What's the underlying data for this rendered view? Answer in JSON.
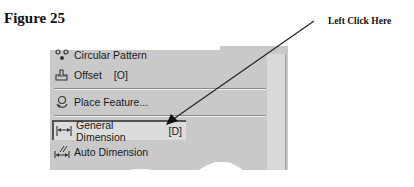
{
  "figure": {
    "title": "Figure 25",
    "callout_text": "Left Click Here"
  },
  "menu": {
    "items": [
      {
        "label": "Circular Pattern",
        "shortcut": "",
        "icon": "circular-pattern-icon"
      },
      {
        "label": "Offset",
        "shortcut": "[O]",
        "icon": "offset-icon"
      },
      {
        "label": "Place Feature...",
        "shortcut": "",
        "icon": "place-feature-icon"
      },
      {
        "label": "General Dimension",
        "shortcut": "[D]",
        "icon": "general-dimension-icon",
        "highlighted": true
      },
      {
        "label": "Auto Dimension",
        "shortcut": "",
        "icon": "auto-dimension-icon"
      }
    ]
  },
  "colors": {
    "menu_bg": "#c9c9c9",
    "highlight_bg": "#dcdcdc",
    "arrow": "#222222"
  }
}
